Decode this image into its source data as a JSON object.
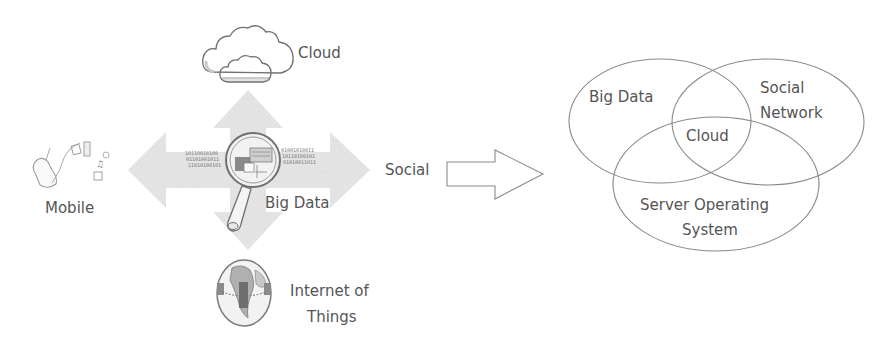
{
  "left_panel": {
    "center": {
      "label": "Big Data",
      "icon": "magnifying-glass-icon"
    },
    "top": {
      "label": "Cloud",
      "icon": "cloud-icon"
    },
    "left": {
      "label": "Mobile",
      "icon": "mobile-apps-icon"
    },
    "right": {
      "label": "Social"
    },
    "bottom": {
      "label_line1": "Internet of",
      "label_line2": "Things",
      "icon": "globe-icon"
    },
    "binary_text_left": [
      "10110010100",
      "01101001011",
      "11010100101"
    ],
    "binary_text_right": [
      "01001010011",
      "10110100101",
      "01010011011"
    ]
  },
  "transition_arrow": {
    "icon": "right-arrow-outline-icon"
  },
  "venn": {
    "sets": [
      {
        "id": "big-data",
        "label": "Big Data"
      },
      {
        "id": "social-network",
        "label_line1": "Social",
        "label_line2": "Network"
      },
      {
        "id": "server-os",
        "label_line1": "Server Operating",
        "label_line2": "System"
      }
    ],
    "intersection": {
      "label": "Cloud"
    }
  },
  "colors": {
    "text": "#555555",
    "lines": "#8a8a8a",
    "cross_arrow_fill": "#e6e6e6",
    "background": "#ffffff"
  }
}
